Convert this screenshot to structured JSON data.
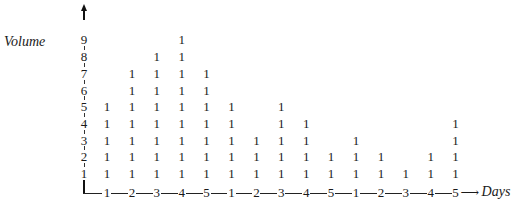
{
  "chart_data": {
    "type": "table",
    "subtype": "stacked tally (histogram of 1s)",
    "title": "",
    "ylabel": "Volume",
    "xlabel": "Days",
    "y_ticks": [
      "1",
      "2",
      "3",
      "4",
      "5",
      "6",
      "7",
      "8",
      "9"
    ],
    "categories": [
      "1",
      "2",
      "3",
      "4",
      "5",
      "1",
      "2",
      "3",
      "4",
      "5",
      "1",
      "2",
      "3",
      "4",
      "5"
    ],
    "values": [
      5,
      7,
      8,
      9,
      7,
      5,
      3,
      5,
      4,
      2,
      3,
      2,
      1,
      2,
      4
    ],
    "cell_symbol": "1",
    "ylim": [
      0,
      9
    ],
    "grid": false,
    "legend": null
  },
  "labels": {
    "volume": "Volume",
    "days": "Days",
    "arrow": "⟶"
  }
}
